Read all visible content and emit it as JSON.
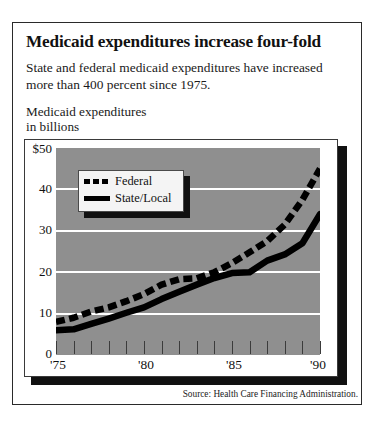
{
  "headline": "Medicaid expenditures increase four-fold",
  "deck": "State and federal medicaid expenditures have increased more than 400 percent since 1975.",
  "axis_caption": "Medicaid expenditures\nin billions",
  "source": "Source:  Health Care Financing Administration.",
  "colors": {
    "plot_background": "#8f8f8f",
    "gridline": "#ffffff",
    "series": "#000000",
    "frame": "#2a2a2a",
    "shadow": "#111111"
  },
  "chart_data": {
    "type": "line",
    "title": "Medicaid expenditures increase four-fold",
    "subtitle": "State and federal medicaid expenditures have increased more than 400 percent since 1975.",
    "xlabel": "",
    "ylabel": "Medicaid expenditures in billions",
    "ylim": [
      0,
      50
    ],
    "xlim": [
      1975,
      1990
    ],
    "grid": true,
    "grid_axis": "y",
    "legend_position": "upper-left-inside",
    "ytick_labels": [
      "$50",
      "40",
      "30",
      "20",
      "10",
      "0"
    ],
    "ytick_values": [
      50,
      40,
      30,
      20,
      10,
      0
    ],
    "xtick_values": [
      1975,
      1976,
      1977,
      1978,
      1979,
      1980,
      1981,
      1982,
      1983,
      1984,
      1985,
      1986,
      1987,
      1988,
      1989,
      1990
    ],
    "xtick_labels": [
      "'75",
      "",
      "",
      "",
      "",
      "'80",
      "",
      "",
      "",
      "",
      "'85",
      "",
      "",
      "",
      "",
      "'90"
    ],
    "x": [
      1975,
      1976,
      1977,
      1978,
      1979,
      1980,
      1981,
      1982,
      1983,
      1984,
      1985,
      1986,
      1987,
      1988,
      1989,
      1990
    ],
    "series": [
      {
        "name": "Federal",
        "style": "dashed",
        "values": [
          8.0,
          9.0,
          10.5,
          11.5,
          13.0,
          14.7,
          17.0,
          18.3,
          18.5,
          20.0,
          22.2,
          24.8,
          27.5,
          31.5,
          37.5,
          45.0
        ]
      },
      {
        "name": "State/Local",
        "style": "solid",
        "values": [
          6.0,
          6.2,
          7.5,
          8.8,
          10.2,
          11.5,
          13.5,
          15.3,
          17.0,
          18.6,
          19.8,
          20.0,
          22.8,
          24.3,
          27.0,
          34.0
        ]
      }
    ]
  },
  "legend": {
    "items": [
      {
        "label": "Federal",
        "style": "dashed"
      },
      {
        "label": "State/Local",
        "style": "solid"
      }
    ]
  }
}
